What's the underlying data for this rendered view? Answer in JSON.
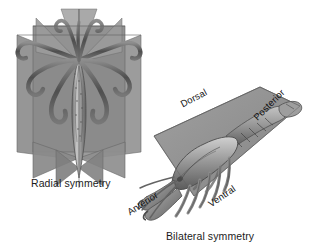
{
  "figure": {
    "background_color": "#ffffff",
    "plane_color": "#8a8a8a",
    "plane_color_light": "#9d9d9d",
    "plane_color_dark": "#6f6f6f",
    "outline_color": "#5a5a5a",
    "body_color": "#a6a6a6",
    "text_color": "#1b1b1b"
  },
  "radial": {
    "caption": "Radial symmetry",
    "organism": "squid",
    "plane_count": 4,
    "icon": "radial-planes-icon"
  },
  "bilateral": {
    "caption": "Bilateral symmetry",
    "organism": "lobster",
    "plane_count": 1,
    "icon": "sagittal-plane-icon",
    "axes": {
      "dorsal": "Dorsal",
      "ventral": "Ventral",
      "anterior": "Anterior",
      "posterior": "Posterior"
    }
  }
}
